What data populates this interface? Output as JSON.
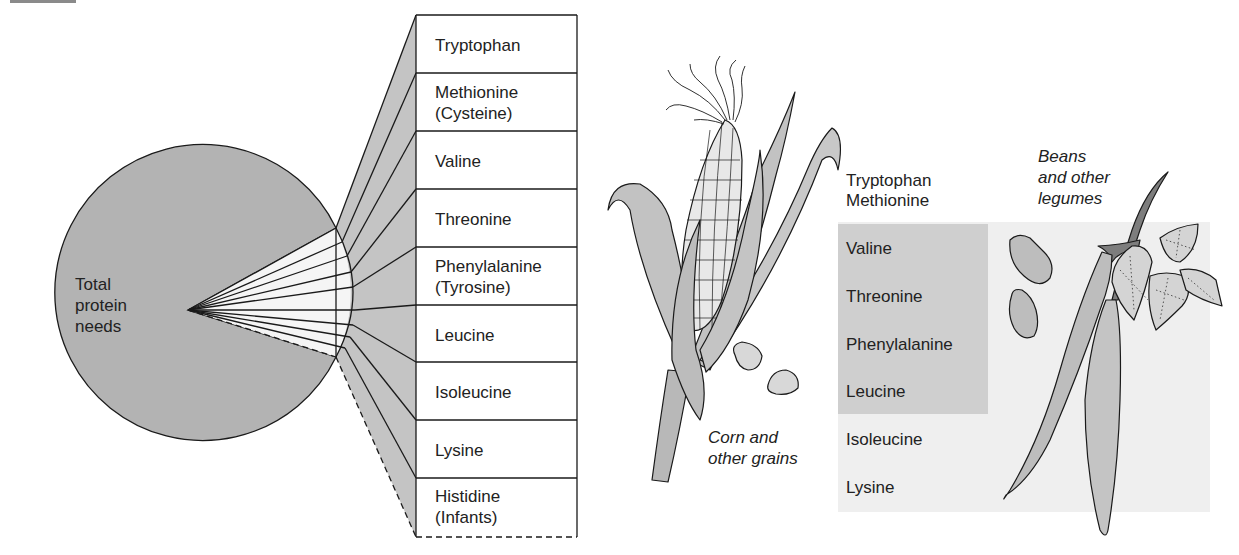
{
  "diagram": {
    "type": "pie-to-table explosion with food illustrations",
    "pie": {
      "label_lines": [
        "Total",
        "protein",
        "needs"
      ],
      "fill": "#b3b3b3",
      "exploded_wedge_fill": "#f5f5f5",
      "segments": 9
    },
    "essential_amino_acids": [
      {
        "lines": [
          "Tryptophan"
        ]
      },
      {
        "lines": [
          "Methionine",
          "(Cysteine)"
        ]
      },
      {
        "lines": [
          "Valine"
        ]
      },
      {
        "lines": [
          "Threonine"
        ]
      },
      {
        "lines": [
          "Phenylalanine",
          "(Tyrosine)"
        ]
      },
      {
        "lines": [
          "Leucine"
        ]
      },
      {
        "lines": [
          "Isoleucine"
        ]
      },
      {
        "lines": [
          "Lysine"
        ]
      },
      {
        "lines": [
          "Histidine",
          "(Infants)"
        ]
      }
    ],
    "complementary": {
      "amino_acids": [
        "Tryptophan",
        "Methionine",
        "Valine",
        "Threonine",
        "Phenylalanine",
        "Leucine",
        "Isoleucine",
        "Lysine"
      ],
      "shared_highlight": [
        "Valine",
        "Threonine",
        "Phenylalanine",
        "Leucine"
      ],
      "highlight_color": "#cfcfcf",
      "band_color": "#efefef"
    },
    "captions": {
      "corn": [
        "Corn and",
        "other grains"
      ],
      "beans": [
        "Beans",
        "and other",
        "legumes"
      ]
    },
    "colors": {
      "line": "#1a1a1a",
      "wedge_band": "#c4c4c4",
      "plant_fill": "#bdbdbd",
      "leaf_fill": "#d4d4d4"
    }
  }
}
